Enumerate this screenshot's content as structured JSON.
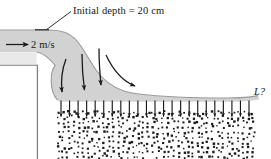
{
  "figure": {
    "title_label": "Initial depth = 20 cm",
    "velocity_label": "2 m/s",
    "length_label": "L?",
    "colors": {
      "fluid_fill": "#d2d2d2",
      "fluid_edge": "#9a9a9a",
      "wall_edge": "#808080",
      "arrow": "#1a1a1a",
      "bed_dot": "#1c1c1c",
      "background": "#ffffff",
      "text": "#161616"
    },
    "geometry": {
      "upstream_surface_y": 30,
      "step_corner_x": 37,
      "step_corner_y": 65,
      "bed_top_y": 110,
      "bed_right_x": 257,
      "downstream_surface_y": 98
    },
    "streamline_arrow_count": 4,
    "infiltration_arrow_count": 23,
    "icons": {
      "velocity_arrow": "arrow-right-icon",
      "leader_line": "leader-line-icon",
      "streamline": "curved-arrow-icon",
      "infiltration": "arrow-down-icon"
    }
  }
}
